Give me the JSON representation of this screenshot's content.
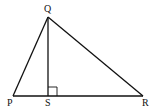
{
  "diagram": {
    "type": "triangle",
    "vertices": {
      "P": {
        "label": "P",
        "x": 13,
        "y": 96
      },
      "Q": {
        "label": "Q",
        "x": 48,
        "y": 17
      },
      "R": {
        "label": "R",
        "x": 143,
        "y": 96
      },
      "S": {
        "label": "S",
        "x": 48,
        "y": 96
      }
    },
    "segments": [
      "PQ",
      "QR",
      "PR",
      "QS"
    ],
    "right_angle_at": "S",
    "labels": {
      "P": "P",
      "Q": "Q",
      "R": "R",
      "S": "S"
    },
    "colors": {
      "line": "#111111",
      "background": "#ffffff"
    }
  }
}
